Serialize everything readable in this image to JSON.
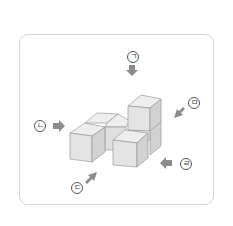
{
  "diagram": {
    "cube_count": 6,
    "views": [
      {
        "id": "giyeok",
        "label": "ㄱ",
        "direction": "top"
      },
      {
        "id": "nieun",
        "label": "ㄴ",
        "direction": "left"
      },
      {
        "id": "digeut",
        "label": "ㄷ",
        "direction": "front-left"
      },
      {
        "id": "rieul",
        "label": "ㄹ",
        "direction": "right"
      },
      {
        "id": "mieum",
        "label": "ㅁ",
        "direction": "back-right"
      }
    ],
    "colors": {
      "frame_border": "#d6d6d6",
      "cube_front": "#e4e4e4",
      "cube_top": "#eeeeee",
      "cube_side": "#d2d2d2",
      "cube_edge": "#9a9a9a",
      "arrow": "#8c8c8c",
      "label_stroke": "#555555"
    }
  }
}
